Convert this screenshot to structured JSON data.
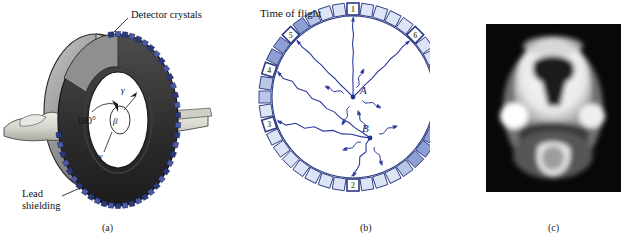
{
  "figure": {
    "panels": [
      {
        "id": "a",
        "caption": "(a)",
        "labels": {
          "detector_crystals": "Detector crystals",
          "lead_shielding_line1": "Lead",
          "lead_shielding_line2": "shielding",
          "angle": "180°",
          "positron": "β",
          "gamma_upper": "γ",
          "gamma_lower": "γ"
        },
        "colors": {
          "gantry_gray": "#9a9a9a",
          "gantry_dark": "#3a3a3a",
          "crystal_navy": "#2b3a80",
          "patient": "#d8d8d2"
        }
      },
      {
        "id": "b",
        "caption": "(b)",
        "title": "Time of flight",
        "point_labels": [
          "A",
          "B"
        ],
        "crystal_numbers": [
          "1",
          "2",
          "3",
          "4",
          "5",
          "6"
        ],
        "crystal_count": 40,
        "colors": {
          "crystal_light": "#dce4f5",
          "crystal_mid": "#b9c6e8",
          "crystal_dark": "#8e9fd4",
          "outline_navy": "#2b3a80",
          "ray_blue": "#2b3a9e"
        }
      },
      {
        "id": "c",
        "caption": "(c)",
        "description": "PET brain scan",
        "colors": {
          "background": "#000000",
          "bright": "#ffffff",
          "mid": "#8a8a8a"
        }
      }
    ]
  }
}
